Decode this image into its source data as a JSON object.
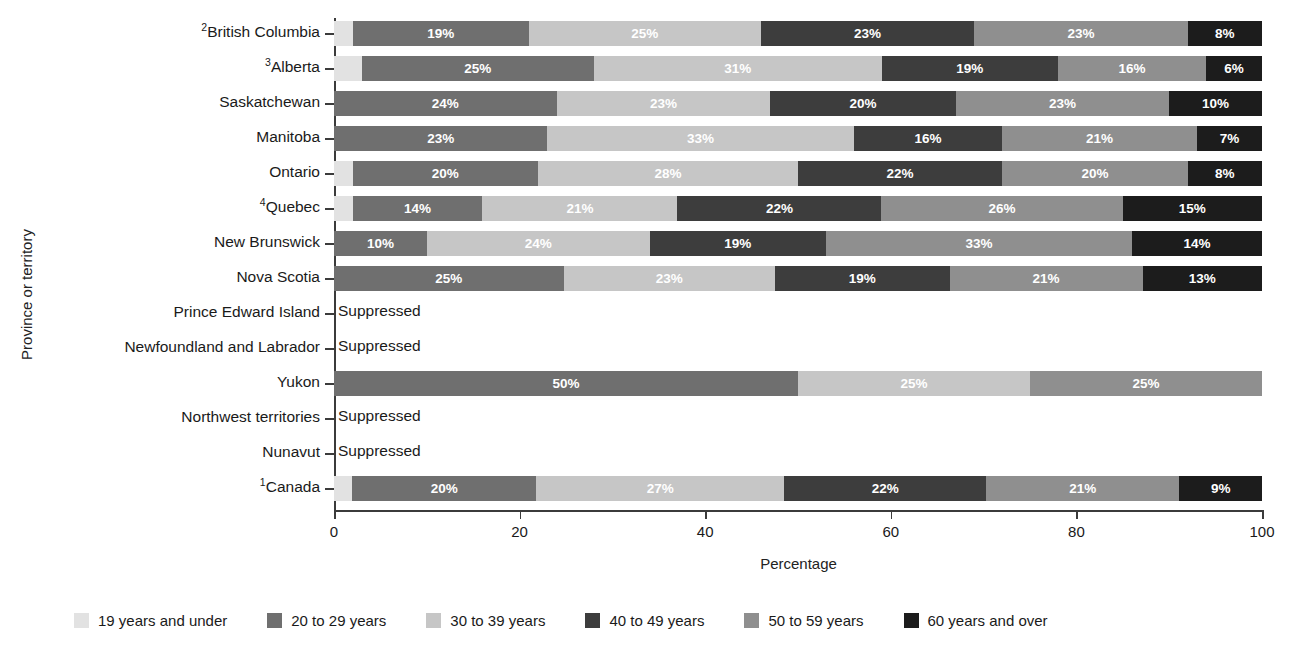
{
  "chart_data": {
    "type": "bar",
    "subtype": "horizontal-stacked-percentage",
    "title": "",
    "xlabel": "Percentage",
    "ylabel": "Province or territory",
    "xlim": [
      0,
      100
    ],
    "xticks": [
      "0",
      "20",
      "40",
      "60",
      "80",
      "100"
    ],
    "grid": false,
    "legend_position": "bottom",
    "suppressed_text": "Suppressed",
    "categories": [
      "British Columbia",
      "Alberta",
      "Saskatchewan",
      "Manitoba",
      "Ontario",
      "Quebec",
      "New Brunswick",
      "Nova Scotia",
      "Prince Edward Island",
      "Newfoundland and Labrador",
      "Yukon",
      "Northwest territories",
      "Nunavut",
      "Canada"
    ],
    "category_superscripts": [
      "2",
      "3",
      "",
      "",
      "",
      "4",
      "",
      "",
      "",
      "",
      "",
      "",
      "",
      "1"
    ],
    "series": [
      {
        "name": "19 years and under",
        "color": "#e2e2e2",
        "values": [
          2,
          3,
          0,
          0,
          2,
          2,
          0,
          0,
          null,
          null,
          0,
          null,
          null,
          2
        ]
      },
      {
        "name": "20 to 29 years",
        "color": "#6f6f6f",
        "values": [
          19,
          25,
          24,
          23,
          20,
          14,
          10,
          25,
          null,
          null,
          50,
          null,
          null,
          20
        ]
      },
      {
        "name": "30 to 39 years",
        "color": "#c6c6c6",
        "values": [
          25,
          31,
          23,
          33,
          28,
          21,
          24,
          23,
          null,
          null,
          25,
          null,
          null,
          27
        ]
      },
      {
        "name": "40 to 49 years",
        "color": "#3d3d3d",
        "values": [
          23,
          19,
          20,
          16,
          22,
          22,
          19,
          19,
          null,
          null,
          0,
          null,
          null,
          22
        ]
      },
      {
        "name": "50 to 59 years",
        "color": "#8f8f8f",
        "values": [
          23,
          16,
          23,
          21,
          20,
          26,
          33,
          21,
          null,
          null,
          25,
          null,
          null,
          21
        ]
      },
      {
        "name": "60 years and over",
        "color": "#1c1c1c",
        "values": [
          8,
          6,
          10,
          7,
          8,
          15,
          14,
          13,
          null,
          null,
          0,
          null,
          null,
          9
        ]
      }
    ],
    "rows": [
      {
        "label": "British Columbia",
        "superscript": "2",
        "suppressed": false,
        "segments": [
          {
            "series": "19 years and under",
            "value": 2,
            "label": ""
          },
          {
            "series": "20 to 29 years",
            "value": 19,
            "label": "19%"
          },
          {
            "series": "30 to 39 years",
            "value": 25,
            "label": "25%"
          },
          {
            "series": "40 to 49 years",
            "value": 23,
            "label": "23%"
          },
          {
            "series": "50 to 59 years",
            "value": 23,
            "label": "23%"
          },
          {
            "series": "60 years and over",
            "value": 8,
            "label": "8%"
          }
        ]
      },
      {
        "label": "Alberta",
        "superscript": "3",
        "suppressed": false,
        "segments": [
          {
            "series": "19 years and under",
            "value": 3,
            "label": ""
          },
          {
            "series": "20 to 29 years",
            "value": 25,
            "label": "25%"
          },
          {
            "series": "30 to 39 years",
            "value": 31,
            "label": "31%"
          },
          {
            "series": "40 to 49 years",
            "value": 19,
            "label": "19%"
          },
          {
            "series": "50 to 59 years",
            "value": 16,
            "label": "16%"
          },
          {
            "series": "60 years and over",
            "value": 6,
            "label": "6%"
          }
        ]
      },
      {
        "label": "Saskatchewan",
        "superscript": "",
        "suppressed": false,
        "segments": [
          {
            "series": "19 years and under",
            "value": 0,
            "label": ""
          },
          {
            "series": "20 to 29 years",
            "value": 24,
            "label": "24%"
          },
          {
            "series": "30 to 39 years",
            "value": 23,
            "label": "23%"
          },
          {
            "series": "40 to 49 years",
            "value": 20,
            "label": "20%"
          },
          {
            "series": "50 to 59 years",
            "value": 23,
            "label": "23%"
          },
          {
            "series": "60 years and over",
            "value": 10,
            "label": "10%"
          }
        ]
      },
      {
        "label": "Manitoba",
        "superscript": "",
        "suppressed": false,
        "segments": [
          {
            "series": "19 years and under",
            "value": 0,
            "label": ""
          },
          {
            "series": "20 to 29 years",
            "value": 23,
            "label": "23%"
          },
          {
            "series": "30 to 39 years",
            "value": 33,
            "label": "33%"
          },
          {
            "series": "40 to 49 years",
            "value": 16,
            "label": "16%"
          },
          {
            "series": "50 to 59 years",
            "value": 21,
            "label": "21%"
          },
          {
            "series": "60 years and over",
            "value": 7,
            "label": "7%"
          }
        ]
      },
      {
        "label": "Ontario",
        "superscript": "",
        "suppressed": false,
        "segments": [
          {
            "series": "19 years and under",
            "value": 2,
            "label": ""
          },
          {
            "series": "20 to 29 years",
            "value": 20,
            "label": "20%"
          },
          {
            "series": "30 to 39 years",
            "value": 28,
            "label": "28%"
          },
          {
            "series": "40 to 49 years",
            "value": 22,
            "label": "22%"
          },
          {
            "series": "50 to 59 years",
            "value": 20,
            "label": "20%"
          },
          {
            "series": "60 years and over",
            "value": 8,
            "label": "8%"
          }
        ]
      },
      {
        "label": "Quebec",
        "superscript": "4",
        "suppressed": false,
        "segments": [
          {
            "series": "19 years and under",
            "value": 2,
            "label": ""
          },
          {
            "series": "20 to 29 years",
            "value": 14,
            "label": "14%"
          },
          {
            "series": "30 to 39 years",
            "value": 21,
            "label": "21%"
          },
          {
            "series": "40 to 49 years",
            "value": 22,
            "label": "22%"
          },
          {
            "series": "50 to 59 years",
            "value": 26,
            "label": "26%"
          },
          {
            "series": "60 years and over",
            "value": 15,
            "label": "15%"
          }
        ]
      },
      {
        "label": "New Brunswick",
        "superscript": "",
        "suppressed": false,
        "segments": [
          {
            "series": "19 years and under",
            "value": 0,
            "label": ""
          },
          {
            "series": "20 to 29 years",
            "value": 10,
            "label": "10%"
          },
          {
            "series": "30 to 39 years",
            "value": 24,
            "label": "24%"
          },
          {
            "series": "40 to 49 years",
            "value": 19,
            "label": "19%"
          },
          {
            "series": "50 to 59 years",
            "value": 33,
            "label": "33%"
          },
          {
            "series": "60 years and over",
            "value": 14,
            "label": "14%"
          }
        ]
      },
      {
        "label": "Nova Scotia",
        "superscript": "",
        "suppressed": false,
        "segments": [
          {
            "series": "19 years and under",
            "value": 0,
            "label": ""
          },
          {
            "series": "20 to 29 years",
            "value": 25,
            "label": "25%"
          },
          {
            "series": "30 to 39 years",
            "value": 23,
            "label": "23%"
          },
          {
            "series": "40 to 49 years",
            "value": 19,
            "label": "19%"
          },
          {
            "series": "50 to 59 years",
            "value": 21,
            "label": "21%"
          },
          {
            "series": "60 years and over",
            "value": 13,
            "label": "13%"
          }
        ]
      },
      {
        "label": "Prince Edward Island",
        "superscript": "",
        "suppressed": true,
        "segments": []
      },
      {
        "label": "Newfoundland and Labrador",
        "superscript": "",
        "suppressed": true,
        "segments": []
      },
      {
        "label": "Yukon",
        "superscript": "",
        "suppressed": false,
        "segments": [
          {
            "series": "19 years and under",
            "value": 0,
            "label": ""
          },
          {
            "series": "20 to 29 years",
            "value": 50,
            "label": "50%"
          },
          {
            "series": "30 to 39 years",
            "value": 25,
            "label": "25%"
          },
          {
            "series": "40 to 49 years",
            "value": 0,
            "label": ""
          },
          {
            "series": "50 to 59 years",
            "value": 25,
            "label": "25%"
          },
          {
            "series": "60 years and over",
            "value": 0,
            "label": ""
          }
        ]
      },
      {
        "label": "Northwest territories",
        "superscript": "",
        "suppressed": true,
        "segments": []
      },
      {
        "label": "Nunavut",
        "superscript": "",
        "suppressed": true,
        "segments": []
      },
      {
        "label": "Canada",
        "superscript": "1",
        "suppressed": false,
        "segments": [
          {
            "series": "19 years and under",
            "value": 2,
            "label": ""
          },
          {
            "series": "20 to 29 years",
            "value": 20,
            "label": "20%"
          },
          {
            "series": "30 to 39 years",
            "value": 27,
            "label": "27%"
          },
          {
            "series": "40 to 49 years",
            "value": 22,
            "label": "22%"
          },
          {
            "series": "50 to 59 years",
            "value": 21,
            "label": "21%"
          },
          {
            "series": "60 years and over",
            "value": 9,
            "label": "9%"
          }
        ]
      }
    ],
    "legend": [
      {
        "label": "19 years and under",
        "color": "#e2e2e2"
      },
      {
        "label": "20 to 29 years",
        "color": "#6f6f6f"
      },
      {
        "label": "30 to 39 years",
        "color": "#c6c6c6"
      },
      {
        "label": "40 to 49 years",
        "color": "#3d3d3d"
      },
      {
        "label": "50 to 59 years",
        "color": "#8f8f8f"
      },
      {
        "label": "60 years and over",
        "color": "#1c1c1c"
      }
    ]
  }
}
